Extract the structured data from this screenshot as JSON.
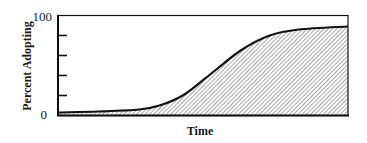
{
  "chart_data": {
    "type": "area",
    "title": "",
    "xlabel": "Time",
    "ylabel": "Percent Adopting",
    "ylim": [
      0,
      100
    ],
    "yticks": [
      0,
      20,
      40,
      60,
      80,
      100
    ],
    "ytick_labels_shown": [
      "0",
      "100"
    ],
    "xticks": [],
    "grid": false,
    "legend": null,
    "fill": "diagonal-hatch",
    "series": [
      {
        "name": "Adoption curve",
        "x": [
          0,
          0.14,
          0.28,
          0.35,
          0.43,
          0.52,
          0.63,
          0.73,
          0.83,
          1.0
        ],
        "values": [
          3,
          4,
          6,
          10,
          20,
          40,
          65,
          80,
          86,
          89
        ]
      }
    ]
  },
  "labels": {
    "y_max": "100",
    "y_min": "0",
    "x_axis": "Time",
    "y_axis": "Percent Adopting"
  },
  "colors": {
    "line": "#111111",
    "hatch": "#555555",
    "background": "#ffffff"
  }
}
